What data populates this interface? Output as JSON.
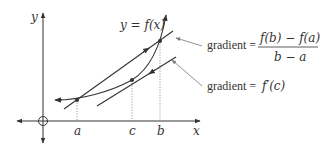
{
  "diagram": {
    "axes": {
      "x_label": "x",
      "y_label": "y",
      "origin_marker": "circle"
    },
    "curve": {
      "label": "y = f(x)",
      "label_parts": {
        "lhs": "y",
        "eq": "=",
        "rhs": "f(x)"
      }
    },
    "points": [
      {
        "name": "a",
        "label": "a"
      },
      {
        "name": "c",
        "label": "c"
      },
      {
        "name": "b",
        "label": "b"
      }
    ],
    "annotations": {
      "secant": {
        "prefix": "gradient =",
        "numerator": "f(b) − f(a)",
        "denominator": "b − a"
      },
      "tangent": {
        "prefix": "gradient =",
        "value": "f′(c)"
      }
    },
    "colors": {
      "ink": "#333333",
      "guide": "#888888",
      "pointer": "#777777"
    }
  }
}
